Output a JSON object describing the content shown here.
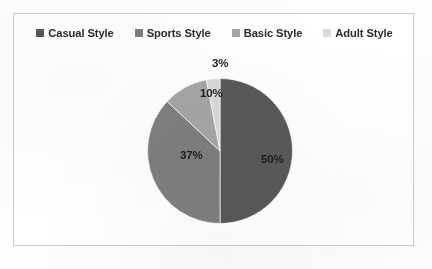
{
  "figure": {
    "background_color": "#ffffff",
    "frame_border_color": "#c9c9c9"
  },
  "legend": {
    "position": "top",
    "items": [
      {
        "label": "Casual Style",
        "color": "#595959"
      },
      {
        "label": "Sports Style",
        "color": "#7f7f7f"
      },
      {
        "label": "Basic Style",
        "color": "#a6a6a6"
      },
      {
        "label": "Adult Style",
        "color": "#d9d9d9"
      }
    ]
  },
  "chart_data": {
    "type": "pie",
    "title": "",
    "xlabel": "",
    "ylabel": "",
    "categories": [
      "Casual Style",
      "Sports Style",
      "Basic Style",
      "Adult Style"
    ],
    "values": [
      50,
      37,
      10,
      3
    ],
    "value_unit": "%",
    "data_labels": [
      "50%",
      "37%",
      "10%",
      "3%"
    ],
    "colors": [
      "#595959",
      "#7f7f7f",
      "#a6a6a6",
      "#d9d9d9"
    ],
    "start_angle_deg": 0,
    "direction": "clockwise",
    "legend_position": "top",
    "grid": false
  }
}
